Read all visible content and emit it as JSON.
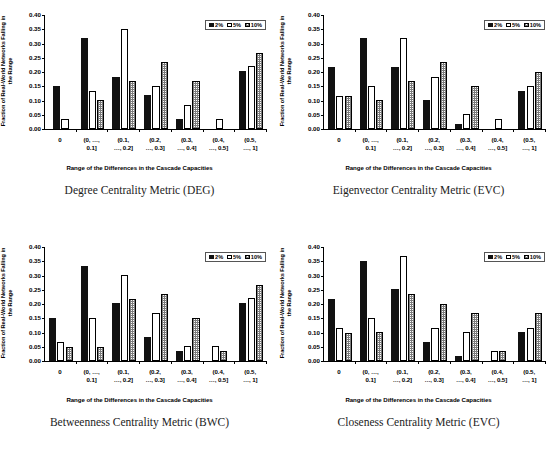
{
  "figure": {
    "legend": [
      {
        "label": "2%",
        "key": "s2",
        "swatch": "black-filled-square-icon"
      },
      {
        "label": "5%",
        "key": "s5",
        "swatch": "white-outline-square-icon"
      },
      {
        "label": "10%",
        "key": "s10",
        "swatch": "gray-hatched-square-icon"
      }
    ],
    "shared": {
      "ylabel": "Fraction of Real-World Networks Falling in the Range",
      "xlabel": "Range of the Differences in the Cascade Capacities",
      "yticks": [
        "0.00",
        "0.05",
        "0.10",
        "0.15",
        "0.20",
        "0.25",
        "0.30",
        "0.35",
        "0.40"
      ],
      "categories": [
        {
          "line1": "0",
          "line2": ""
        },
        {
          "line1": "(0, …,",
          "line2": "0.1]"
        },
        {
          "line1": "(0.1,",
          "line2": "…, 0.2]"
        },
        {
          "line1": "(0.2,",
          "line2": "…, 0.3]"
        },
        {
          "line1": "(0.3,",
          "line2": "…, 0.4]"
        },
        {
          "line1": "(0.4,",
          "line2": "…, 0.5]"
        },
        {
          "line1": "(0.5,",
          "line2": "…, 1]"
        }
      ]
    }
  },
  "chart_data": [
    {
      "type": "bar",
      "id": "deg",
      "title": "Degree Centrality Metric (DEG)",
      "xlabel": "Range of the Differences in the Cascade Capacities",
      "ylabel": "Fraction of Real-World Networks Falling in the Range",
      "ylim": [
        0,
        0.4
      ],
      "ytick_step": 0.05,
      "grid": false,
      "legend_position": "top-right",
      "categories": [
        "0",
        "(0, ..., 0.1]",
        "(0.1, ..., 0.2]",
        "(0.2, ..., 0.3]",
        "(0.3, ..., 0.4]",
        "(0.4, ..., 0.5]",
        "(0.5, ..., 1]"
      ],
      "series": [
        {
          "name": "2%",
          "values": [
            0.15,
            0.318,
            0.184,
            0.118,
            0.035,
            0.0,
            0.203
          ]
        },
        {
          "name": "5%",
          "values": [
            0.034,
            0.134,
            0.351,
            0.151,
            0.084,
            0.035,
            0.22
          ]
        },
        {
          "name": "10%",
          "values": [
            0.0,
            0.101,
            0.167,
            0.235,
            0.167,
            0.0,
            0.268
          ]
        }
      ]
    },
    {
      "type": "bar",
      "id": "evc",
      "title": "Eigenvector Centrality Metric (EVC)",
      "xlabel": "Range of the Differences in the Cascade Capacities",
      "ylabel": "Fraction of Real-World Networks Falling in the Range",
      "ylim": [
        0,
        0.4
      ],
      "ytick_step": 0.05,
      "grid": false,
      "legend_position": "top-right",
      "categories": [
        "0",
        "(0, ..., 0.1]",
        "(0.1, ..., 0.2]",
        "(0.2, ..., 0.3]",
        "(0.3, ..., 0.4]",
        "(0.4, ..., 0.5]",
        "(0.5, ..., 1]"
      ],
      "series": [
        {
          "name": "2%",
          "values": [
            0.217,
            0.318,
            0.218,
            0.101,
            0.019,
            0.0,
            0.134
          ]
        },
        {
          "name": "5%",
          "values": [
            0.117,
            0.151,
            0.318,
            0.184,
            0.051,
            0.035,
            0.151
          ]
        },
        {
          "name": "10%",
          "values": [
            0.117,
            0.101,
            0.167,
            0.235,
            0.151,
            0.0,
            0.201
          ]
        }
      ]
    },
    {
      "type": "bar",
      "id": "bwc",
      "title": "Betweenness Centrality Metric (BWC)",
      "xlabel": "Range of the Differences in the Cascade Capacities",
      "ylabel": "Fraction of Real-World Networks Falling in the Range",
      "ylim": [
        0,
        0.4
      ],
      "ytick_step": 0.05,
      "grid": false,
      "legend_position": "top-right",
      "categories": [
        "0",
        "(0, ..., 0.1]",
        "(0.1, ..., 0.2]",
        "(0.2, ..., 0.3]",
        "(0.3, ..., 0.4]",
        "(0.4, ..., 0.5]",
        "(0.5, ..., 1]"
      ],
      "series": [
        {
          "name": "2%",
          "values": [
            0.15,
            0.335,
            0.202,
            0.084,
            0.034,
            0.0,
            0.203
          ]
        },
        {
          "name": "5%",
          "values": [
            0.067,
            0.151,
            0.302,
            0.167,
            0.051,
            0.051,
            0.22
          ]
        },
        {
          "name": "10%",
          "values": [
            0.05,
            0.05,
            0.218,
            0.235,
            0.151,
            0.035,
            0.268
          ]
        }
      ]
    },
    {
      "type": "bar",
      "id": "clc",
      "title": "Closeness Centrality Metric (EVC)",
      "xlabel": "Range of the Differences in the Cascade Capacities",
      "ylabel": "Fraction of Real-World Networks Falling in the Range",
      "ylim": [
        0,
        0.4
      ],
      "ytick_step": 0.05,
      "grid": false,
      "legend_position": "top-right",
      "categories": [
        "0",
        "(0, ..., 0.1]",
        "(0.1, ..., 0.2]",
        "(0.2, ..., 0.3]",
        "(0.3, ..., 0.4]",
        "(0.4, ..., 0.5]",
        "(0.5, ..., 1]"
      ],
      "series": [
        {
          "name": "2%",
          "values": [
            0.217,
            0.351,
            0.251,
            0.067,
            0.018,
            0.0,
            0.101
          ]
        },
        {
          "name": "5%",
          "values": [
            0.117,
            0.151,
            0.367,
            0.117,
            0.101,
            0.035,
            0.117
          ]
        },
        {
          "name": "10%",
          "values": [
            0.1,
            0.101,
            0.235,
            0.201,
            0.167,
            0.035,
            0.167
          ]
        }
      ]
    }
  ]
}
